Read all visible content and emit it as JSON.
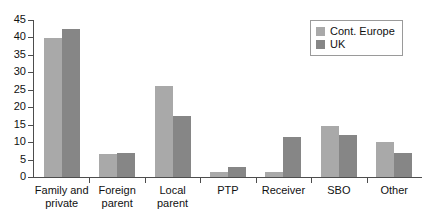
{
  "chart_data": {
    "type": "bar",
    "title": "",
    "xlabel": "",
    "ylabel": "",
    "ylim": [
      0,
      45
    ],
    "ytick_step": 5,
    "yticks": [
      "0",
      "5",
      "10",
      "15",
      "20",
      "25",
      "30",
      "35",
      "40",
      "45"
    ],
    "grid": false,
    "legend_position": "top-right",
    "categories": [
      "Family and private",
      "Foreign parent",
      "Local parent",
      "PTP",
      "Receiver",
      "SBO",
      "Other"
    ],
    "category_lines": [
      [
        "Family and",
        "private"
      ],
      [
        "Foreign",
        "parent"
      ],
      [
        "Local",
        "parent"
      ],
      [
        "PTP",
        ""
      ],
      [
        "Receiver",
        ""
      ],
      [
        "SBO",
        ""
      ],
      [
        "Other",
        ""
      ]
    ],
    "series": [
      {
        "name": "Cont. Europe",
        "color": "#a9a9a9",
        "values": [
          39.8,
          6.6,
          26.0,
          1.5,
          1.5,
          14.7,
          10.0
        ]
      },
      {
        "name": "UK",
        "color": "#868686",
        "values": [
          42.5,
          7.0,
          17.5,
          3.0,
          11.5,
          12.0,
          7.0
        ]
      }
    ]
  },
  "legend": {
    "entries": [
      {
        "label": "Cont. Europe",
        "color": "#a9a9a9"
      },
      {
        "label": "UK",
        "color": "#868686"
      }
    ]
  },
  "axis": {
    "line_color": "#4d4d4d"
  }
}
